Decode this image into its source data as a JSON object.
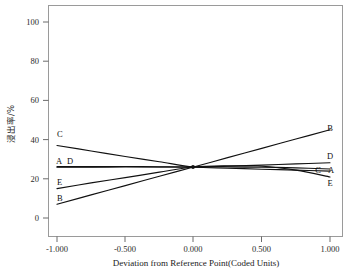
{
  "chart_data": {
    "type": "line",
    "title": "",
    "subtitle": "",
    "xlabel": "Deviation from Reference Point(Coded Units)",
    "ylabel": "浸出率/%",
    "xlim": [
      -1.0,
      1.0
    ],
    "ylim": [
      0,
      100
    ],
    "xticks": [
      -1.0,
      -0.5,
      0.0,
      0.5,
      1.0
    ],
    "xtick_labels": [
      "-1.000",
      "-0.500",
      "0.000",
      "0.500",
      "1.000"
    ],
    "yticks": [
      0,
      20,
      40,
      60,
      80,
      100
    ],
    "ytick_labels": [
      "0",
      "20",
      "40",
      "60",
      "80",
      "100"
    ],
    "grid": false,
    "legend": "inline-endpoint-labels",
    "reference_point": {
      "x": 0.0,
      "y": 26.0
    },
    "x": [
      -1.0,
      -0.75,
      -0.5,
      -0.25,
      0.0,
      0.25,
      0.5,
      0.75,
      1.0
    ],
    "series": [
      {
        "name": "A",
        "label_left": "A",
        "label_right": "A",
        "values": [
          25.9,
          25.95,
          26.0,
          26.0,
          26.0,
          26.0,
          25.9,
          25.6,
          25.0
        ],
        "color": "#111111"
      },
      {
        "name": "B",
        "label_left": "B",
        "label_right": "B",
        "values": [
          7.0,
          11.8,
          16.5,
          21.3,
          26.0,
          30.8,
          35.5,
          40.3,
          45.0
        ],
        "color": "#111111"
      },
      {
        "name": "C",
        "label_left": "C",
        "label_right": "C",
        "values": [
          37.0,
          34.2,
          31.4,
          28.7,
          26.0,
          25.4,
          24.9,
          24.4,
          23.9
        ],
        "color": "#111111"
      },
      {
        "name": "D",
        "label_left": "D",
        "label_right": "D",
        "values": [
          26.2,
          26.2,
          26.3,
          26.1,
          26.0,
          26.4,
          27.0,
          27.6,
          28.2
        ],
        "color": "#111111"
      },
      {
        "name": "E",
        "label_left": "E",
        "label_right": "E",
        "values": [
          15.0,
          17.9,
          20.6,
          23.4,
          26.0,
          26.6,
          26.4,
          24.4,
          20.9
        ],
        "color": "#111111"
      }
    ],
    "annotations": [
      {
        "text": "A",
        "side": "left",
        "x": -1.0,
        "y": 26.0
      },
      {
        "text": "D",
        "side": "left",
        "x": -1.0,
        "y": 26.2
      },
      {
        "text": "C",
        "side": "left",
        "x": -1.0,
        "y": 37.0
      },
      {
        "text": "E",
        "side": "left",
        "x": -1.0,
        "y": 15.0
      },
      {
        "text": "B",
        "side": "left",
        "x": -1.0,
        "y": 7.0
      },
      {
        "text": "B",
        "side": "right",
        "x": 1.0,
        "y": 45.0
      },
      {
        "text": "D",
        "side": "right",
        "x": 1.0,
        "y": 28.2
      },
      {
        "text": "C",
        "side": "right",
        "x": 1.0,
        "y": 23.9
      },
      {
        "text": "A",
        "side": "right",
        "x": 1.0,
        "y": 25.0
      },
      {
        "text": "E",
        "side": "right",
        "x": 1.0,
        "y": 20.9
      }
    ]
  },
  "axes": {
    "x_title": "Deviation from Reference Point(Coded Units)",
    "y_title": "浸出率/%",
    "xtick_0": "-1.000",
    "xtick_1": "-0.500",
    "xtick_2": "0.000",
    "xtick_3": "0.500",
    "xtick_4": "1.000",
    "ytick_0": "0",
    "ytick_1": "20",
    "ytick_2": "40",
    "ytick_3": "60",
    "ytick_4": "80",
    "ytick_5": "100"
  },
  "labels": {
    "left_c": "C",
    "left_a": "A",
    "left_d": "D",
    "left_e": "E",
    "left_b": "B",
    "right_b": "B",
    "right_d": "D",
    "right_c": "C",
    "right_a": "A",
    "right_e": "E"
  }
}
